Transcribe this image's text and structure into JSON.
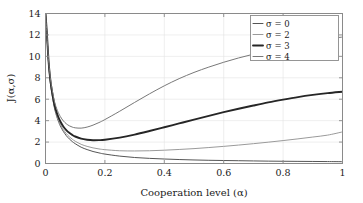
{
  "figure": {
    "background_color": "#ffffff",
    "frame_color": "#8a8a8a",
    "grid_color": "#e2e2e2"
  },
  "chart_data": {
    "type": "line",
    "title": "",
    "subtitle": "",
    "xlabel": "Cooperation level (α)",
    "ylabel": "J(α,σ)",
    "xlim": [
      0,
      1
    ],
    "ylim": [
      0,
      14
    ],
    "xticks": [
      0,
      0.2,
      0.4,
      0.6,
      0.8,
      1
    ],
    "xticklabels": [
      "0",
      "0.2",
      "0.4",
      "0.6",
      "0.8",
      "1"
    ],
    "yticks": [
      0,
      2,
      4,
      6,
      8,
      10,
      12,
      14
    ],
    "yticklabels": [
      "0",
      "2",
      "4",
      "6",
      "8",
      "10",
      "12",
      "14"
    ],
    "grid": true,
    "legend_position": "upper right",
    "legend_entries": [
      "σ = 0",
      "σ = 2",
      "σ = 3",
      "σ = 4"
    ],
    "x": [
      0.005,
      0.01,
      0.015,
      0.02,
      0.03,
      0.04,
      0.05,
      0.06,
      0.07,
      0.08,
      0.09,
      0.1,
      0.12,
      0.14,
      0.16,
      0.18,
      0.2,
      0.25,
      0.3,
      0.35,
      0.4,
      0.45,
      0.5,
      0.55,
      0.6,
      0.65,
      0.7,
      0.75,
      0.8,
      0.85,
      0.9,
      0.95,
      1.0
    ],
    "series": [
      {
        "name": "σ = 0",
        "label": "σ = 0",
        "color": "#555555",
        "width": 1.0,
        "values": [
          11.9,
          9.5,
          7.9,
          6.8,
          5.2,
          4.2,
          3.5,
          3.0,
          2.6,
          2.3,
          2.05,
          1.85,
          1.52,
          1.3,
          1.12,
          0.99,
          0.88,
          0.69,
          0.56,
          0.48,
          0.42,
          0.37,
          0.33,
          0.3,
          0.28,
          0.26,
          0.24,
          0.22,
          0.21,
          0.2,
          0.19,
          0.18,
          0.17
        ]
      },
      {
        "name": "σ = 2",
        "label": "σ = 2",
        "color": "#9a9a9a",
        "width": 1.0,
        "values": [
          11.95,
          9.57,
          8.0,
          6.9,
          5.32,
          4.35,
          3.66,
          3.17,
          2.79,
          2.5,
          2.27,
          2.08,
          1.79,
          1.6,
          1.46,
          1.36,
          1.29,
          1.19,
          1.17,
          1.19,
          1.24,
          1.31,
          1.39,
          1.49,
          1.6,
          1.72,
          1.85,
          1.99,
          2.14,
          2.3,
          2.47,
          2.65,
          2.95
        ]
      },
      {
        "name": "σ = 3",
        "label": "σ = 3",
        "color": "#262626",
        "width": 1.9,
        "values": [
          12.0,
          9.66,
          8.12,
          7.05,
          5.5,
          4.57,
          3.92,
          3.46,
          3.12,
          2.86,
          2.67,
          2.52,
          2.32,
          2.22,
          2.17,
          2.18,
          2.22,
          2.42,
          2.7,
          3.03,
          3.38,
          3.74,
          4.1,
          4.45,
          4.79,
          5.11,
          5.41,
          5.7,
          5.96,
          6.2,
          6.4,
          6.57,
          6.7
        ]
      },
      {
        "name": "σ = 4",
        "label": "σ = 4",
        "color": "#787878",
        "width": 1.0,
        "values": [
          12.05,
          9.78,
          8.3,
          7.28,
          5.82,
          4.95,
          4.38,
          3.98,
          3.71,
          3.52,
          3.4,
          3.33,
          3.3,
          3.4,
          3.58,
          3.82,
          4.1,
          4.88,
          5.7,
          6.5,
          7.25,
          7.92,
          8.5,
          9.0,
          9.45,
          9.85,
          10.2,
          10.55,
          10.9,
          11.2,
          11.45,
          11.65,
          11.8
        ]
      }
    ]
  }
}
